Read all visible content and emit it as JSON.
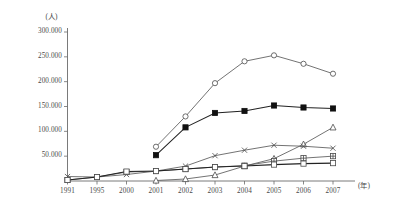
{
  "chart_data": {
    "type": "line",
    "title": "",
    "subtitle": "",
    "xlabel": "(年)",
    "ylabel": "(人)",
    "grid": false,
    "legend_position": "none",
    "x": [
      "1991",
      "1995",
      "2000",
      "2001",
      "2002",
      "2003",
      "2004",
      "2005",
      "2006",
      "2007"
    ],
    "categories": [
      "1991",
      "1995",
      "2000",
      "2001",
      "2002",
      "2003",
      "2004",
      "2005",
      "2006",
      "2007"
    ],
    "xlim": [
      0,
      9
    ],
    "ylim": [
      0,
      300000
    ],
    "yticks": [
      50000,
      100000,
      150000,
      200000,
      250000,
      300000
    ],
    "ytick_labels": [
      "50.000",
      "100.000",
      "150.000",
      "200.000",
      "250.000",
      "300.000"
    ],
    "xtick_labels": [
      "1991",
      "1995",
      "2000",
      "2001",
      "2002",
      "2003",
      "2004",
      "2005",
      "2006",
      "2007"
    ],
    "series": [
      {
        "name": "series-open-circle",
        "marker": "open-circle",
        "values": [
          null,
          null,
          null,
          69000,
          130000,
          197000,
          241000,
          253000,
          236000,
          216000
        ]
      },
      {
        "name": "series-filled-square",
        "marker": "filled-square",
        "values": [
          null,
          null,
          null,
          52000,
          108000,
          137000,
          141000,
          152000,
          148000,
          146000
        ]
      },
      {
        "name": "series-open-triangle",
        "marker": "open-triangle",
        "values": [
          null,
          null,
          null,
          1000,
          4000,
          12000,
          30000,
          45000,
          74000,
          108000
        ]
      },
      {
        "name": "series-cross",
        "marker": "cross",
        "values": [
          9000,
          8000,
          13000,
          20000,
          30000,
          51000,
          62000,
          72000,
          70000,
          66000
        ]
      },
      {
        "name": "series-asterisk-square",
        "marker": "plus-square",
        "values": [
          2000,
          8000,
          18000,
          20000,
          24000,
          28000,
          31000,
          40000,
          46000,
          50000
        ]
      },
      {
        "name": "series-open-square",
        "marker": "open-square",
        "values": [
          2000,
          8000,
          19000,
          20000,
          24000,
          28000,
          30000,
          33000,
          35000,
          36000
        ]
      }
    ]
  },
  "axes": {
    "y_unit": "(人)",
    "x_unit": "(年)"
  }
}
